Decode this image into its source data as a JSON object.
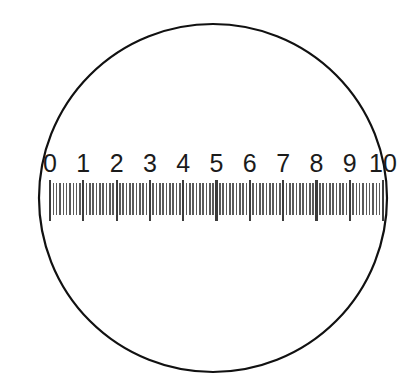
{
  "figure": {
    "kind": "microscope-eyepiece-reticle",
    "title": "",
    "background_color": "#ffffff"
  },
  "lens": {
    "name": "field-of-view-circle",
    "center_x": 213,
    "center_y": 198,
    "radius": 174,
    "stroke_color": "#111111",
    "stroke_width": 2.2,
    "fill_color": "#ffffff"
  },
  "scale": {
    "name": "linear-reticle-scale",
    "orientation": "horizontal",
    "start_x": 50,
    "end_x": 383,
    "baseline_y": 221,
    "major_tick_top_y": 180,
    "major_tick_bottom_y": 221,
    "minor_tick_top_y": 183,
    "minor_tick_bottom_y": 215,
    "major_tick_color": "#3b3b3b",
    "minor_tick_color": "#5a5a5a",
    "major_tick_width": 2.2,
    "minor_tick_width": 1.6,
    "minor_per_division": 9,
    "division_count": 10,
    "label_baseline_y": 172,
    "label_font_size": 25,
    "label_color": "#1b1b1b",
    "labels": [
      "0",
      "1",
      "2",
      "3",
      "4",
      "5",
      "6",
      "7",
      "8",
      "9",
      "10"
    ],
    "major_values": [
      0,
      1,
      2,
      3,
      4,
      5,
      6,
      7,
      8,
      9,
      10
    ]
  },
  "chart_data": {
    "type": "table",
    "xlabel": "",
    "ylabel": "",
    "categories": [
      "0",
      "1",
      "2",
      "3",
      "4",
      "5",
      "6",
      "7",
      "8",
      "9",
      "10"
    ],
    "values": [
      0,
      1,
      2,
      3,
      4,
      5,
      6,
      7,
      8,
      9,
      10
    ],
    "xlim": [
      0,
      10
    ],
    "grid": false,
    "legend": "none"
  }
}
